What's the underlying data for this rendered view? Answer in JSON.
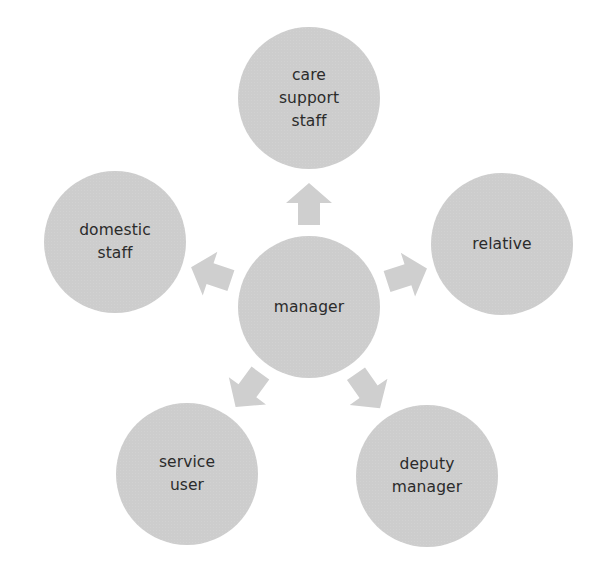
{
  "diagram": {
    "type": "radial-hub",
    "center": {
      "id": "manager",
      "label": "manager",
      "cx": 309,
      "cy": 307
    },
    "nodes": [
      {
        "id": "care-support-staff",
        "label": "care\nsupport\nstaff",
        "cx": 309,
        "cy": 98
      },
      {
        "id": "relative",
        "label": "relative",
        "cx": 502,
        "cy": 244
      },
      {
        "id": "deputy-manager",
        "label": "deputy\nmanager",
        "cx": 427,
        "cy": 476
      },
      {
        "id": "service-user",
        "label": "service\nuser",
        "cx": 187,
        "cy": 474
      },
      {
        "id": "domestic-staff",
        "label": "domestic\nstaff",
        "cx": 115,
        "cy": 242
      }
    ],
    "edges": [
      {
        "from": "manager",
        "to": "care-support-staff",
        "style": "block-arrow"
      },
      {
        "from": "manager",
        "to": "relative",
        "style": "block-arrow"
      },
      {
        "from": "manager",
        "to": "deputy-manager",
        "style": "block-arrow"
      },
      {
        "from": "manager",
        "to": "service-user",
        "style": "block-arrow"
      },
      {
        "from": "manager",
        "to": "domestic-staff",
        "style": "block-arrow"
      }
    ],
    "colors": {
      "node_fill": "#cdcdcd",
      "arrow_fill": "#cfcfcf",
      "text": "#2b2b2b",
      "background": "#ffffff"
    }
  }
}
